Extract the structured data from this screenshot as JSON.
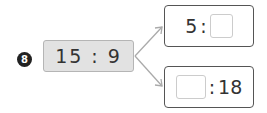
{
  "problem": {
    "number": "8",
    "source_ratio": "15 : 9",
    "targets": [
      {
        "left": "5",
        "separator": ":",
        "right": ""
      },
      {
        "left": "",
        "separator": ":",
        "right": "18"
      }
    ]
  },
  "colors": {
    "badge": "#222222",
    "source_fill": "#e2e2e2",
    "arrow": "#aaaaaa"
  }
}
